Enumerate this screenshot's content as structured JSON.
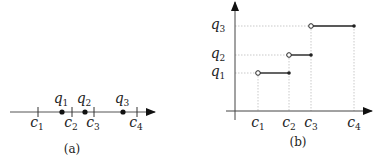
{
  "panel_a": {
    "caption": "(a)",
    "axis": {
      "x_start": 10,
      "x_end": 155,
      "y": 112
    },
    "ticks": [
      {
        "name": "c",
        "sub": "1",
        "x": 38
      },
      {
        "name": "c",
        "sub": "2",
        "x": 72
      },
      {
        "name": "c",
        "sub": "3",
        "x": 94
      },
      {
        "name": "c",
        "sub": "4",
        "x": 137
      }
    ],
    "points": [
      {
        "name": "q",
        "sub": "1",
        "x": 62
      },
      {
        "name": "q",
        "sub": "2",
        "x": 85
      },
      {
        "name": "q",
        "sub": "3",
        "x": 123
      }
    ]
  },
  "panel_b": {
    "caption": "(b)",
    "origin": {
      "x": 235,
      "y": 111
    },
    "x_axis_end": 372,
    "y_axis_top": 2,
    "x_labels": [
      {
        "name": "c",
        "sub": "1",
        "x": 258
      },
      {
        "name": "c",
        "sub": "2",
        "x": 289
      },
      {
        "name": "c",
        "sub": "3",
        "x": 311
      },
      {
        "name": "c",
        "sub": "4",
        "x": 354
      }
    ],
    "y_labels": [
      {
        "name": "q",
        "sub": "1",
        "y": 73
      },
      {
        "name": "q",
        "sub": "2",
        "y": 55
      },
      {
        "name": "q",
        "sub": "3",
        "y": 26
      }
    ],
    "steps": [
      {
        "from": "c1",
        "to": "c2",
        "level": "q1",
        "open_start": true,
        "closed_end": true
      },
      {
        "from": "c2",
        "to": "c3",
        "level": "q2",
        "open_start": true,
        "closed_end": true
      },
      {
        "from": "c3",
        "to": "c4",
        "level": "q3",
        "open_start": true,
        "closed_end": true
      }
    ]
  }
}
